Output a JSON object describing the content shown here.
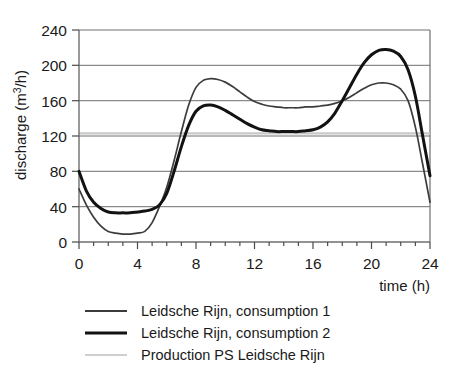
{
  "chart_data": {
    "type": "line",
    "title": "",
    "xlabel": "time (h)",
    "ylabel": "discharge (m3/h)",
    "ylabel_display": "discharge (m",
    "ylabel_sup": "3",
    "ylabel_tail": "/h)",
    "xlim": [
      0,
      24
    ],
    "ylim": [
      0,
      240
    ],
    "grid": true,
    "legend_position": "below",
    "x_ticks_major": [
      0,
      4,
      8,
      12,
      16,
      20,
      24
    ],
    "x_ticks_minor_step": 1,
    "y_ticks": [
      0,
      40,
      80,
      120,
      160,
      200,
      240
    ],
    "x_tick_labels": [
      "0",
      "4",
      "8",
      "12",
      "16",
      "20",
      "24"
    ],
    "y_tick_labels": [
      "0",
      "40",
      "80",
      "120",
      "160",
      "200",
      "240"
    ],
    "colors": {
      "consumption_1": "#3c3c3c",
      "consumption_2": "#121212",
      "production": "#c9c9c9",
      "grid": "#6e6e6e",
      "background": "#ffffff"
    },
    "x": [
      0,
      0.5,
      1,
      1.5,
      2,
      2.5,
      3,
      3.5,
      4,
      4.5,
      5,
      5.5,
      6,
      6.5,
      7,
      7.5,
      8,
      8.5,
      9,
      9.5,
      10,
      10.5,
      11,
      11.5,
      12,
      12.5,
      13,
      13.5,
      14,
      14.5,
      15,
      15.5,
      16,
      16.5,
      17,
      17.5,
      18,
      18.5,
      19,
      19.5,
      20,
      20.5,
      21,
      21.5,
      22,
      22.5,
      23,
      23.5,
      24
    ],
    "series": [
      {
        "name": "Leidsche Rijn, consumption 1",
        "color": "#3c3c3c",
        "line_width": 1.7,
        "values": [
          60,
          42,
          28,
          18,
          12,
          10,
          9,
          9,
          10,
          12,
          22,
          40,
          62,
          92,
          125,
          155,
          175,
          183,
          185,
          184,
          181,
          176,
          170,
          164,
          159,
          156,
          154,
          153,
          152,
          152,
          152,
          153,
          153,
          154,
          155,
          157,
          160,
          164,
          169,
          174,
          178,
          180,
          180,
          178,
          173,
          160,
          130,
          88,
          45
        ]
      },
      {
        "name": "Leidsche Rijn, consumption 2",
        "color": "#121212",
        "line_width": 3.0,
        "values": [
          80,
          58,
          45,
          38,
          34,
          33,
          33,
          33,
          34,
          35,
          37,
          42,
          55,
          80,
          108,
          132,
          148,
          154,
          155,
          153,
          149,
          144,
          139,
          134,
          130,
          127,
          126,
          125,
          125,
          125,
          125,
          126,
          127,
          130,
          136,
          146,
          160,
          175,
          190,
          203,
          212,
          217,
          218,
          216,
          210,
          195,
          165,
          120,
          75
        ]
      },
      {
        "name": "Production PS Leidsche Rijn",
        "color": "#c9c9c9",
        "line_width": 2.2,
        "constant": 123,
        "values": [
          123,
          123,
          123,
          123,
          123,
          123,
          123,
          123,
          123,
          123,
          123,
          123,
          123,
          123,
          123,
          123,
          123,
          123,
          123,
          123,
          123,
          123,
          123,
          123,
          123,
          123,
          123,
          123,
          123,
          123,
          123,
          123,
          123,
          123,
          123,
          123,
          123,
          123,
          123,
          123,
          123,
          123,
          123,
          123,
          123,
          123,
          123,
          123,
          123
        ]
      }
    ],
    "legend": [
      {
        "label": "Leidsche Rijn, consumption 1",
        "swatch": "sw-1"
      },
      {
        "label": "Leidsche Rijn, consumption 2",
        "swatch": "sw-2"
      },
      {
        "label": "Production PS Leidsche Rijn",
        "swatch": "sw-3"
      }
    ]
  }
}
